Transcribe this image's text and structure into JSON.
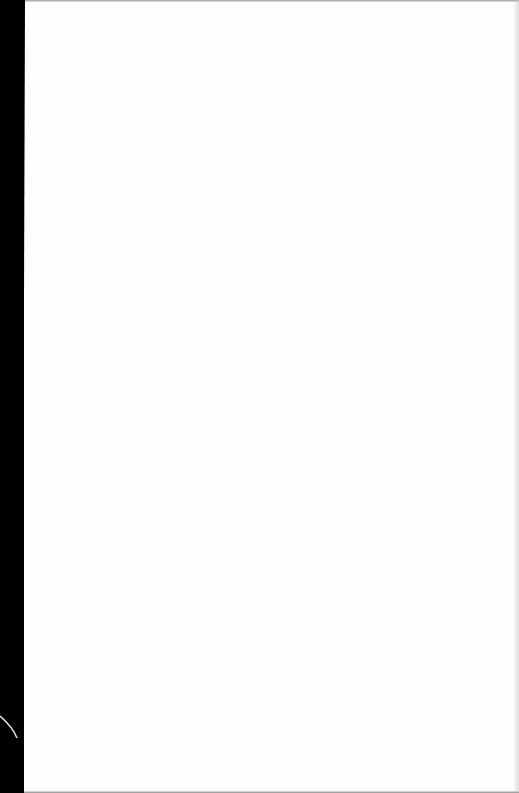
{
  "document": {
    "type": "scanned-page",
    "blank": true,
    "text_content": ""
  },
  "colors": {
    "page_background": "#fefefe",
    "scanner_background": "#000000",
    "edge_shadow": "#9a9a9a"
  }
}
